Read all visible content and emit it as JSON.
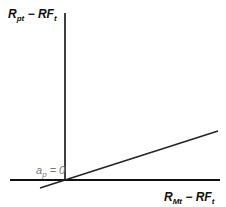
{
  "diagram": {
    "y_axis_label": {
      "main": "R",
      "sub": "pt",
      "rest": " − RF",
      "sub2": "t"
    },
    "x_axis_label": {
      "main": "R",
      "sub": "Mt",
      "rest": " − RF",
      "sub2": "t"
    },
    "intercept_label": {
      "main": "a",
      "sub": "p",
      "rest": " = 0"
    },
    "colors": {
      "axis": "#111111",
      "line": "#222222",
      "intercept_text": "#777777"
    }
  }
}
